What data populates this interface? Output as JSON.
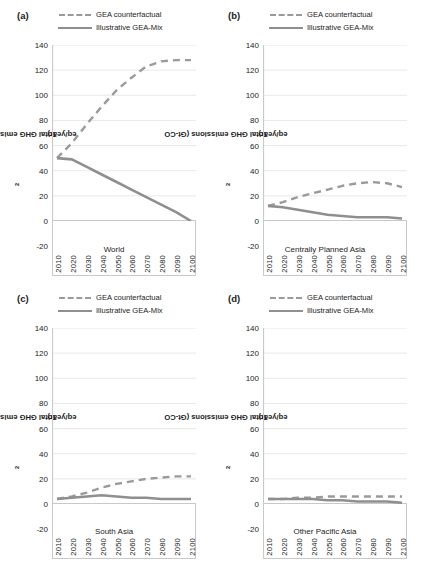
{
  "figure": {
    "axis_title_y": "Total GHG emissions (Gt-CO",
    "axis_title_y_sub": "2",
    "axis_title_y_tail": "eq/year)"
  },
  "legend": {
    "counterfactual": "GEA counterfactual",
    "gea_mix": "Illustrative GEA-Mix"
  },
  "colors": {
    "counterfactual_line": "#9a9a9a",
    "gea_mix_line": "#8f8f8f",
    "gridline": "#e2e2e2",
    "axis": "#c9c9c9",
    "text": "#1c1c1c"
  },
  "panels": [
    {
      "letter": "(a)",
      "region": "World"
    },
    {
      "letter": "(b)",
      "region": "Centrally Planned Asia"
    },
    {
      "letter": "(c)",
      "region": "South Asia"
    },
    {
      "letter": "(d)",
      "region": "Other Pacific Asia"
    }
  ],
  "chart_data": [
    {
      "type": "line",
      "panel": "(a)",
      "title": "World",
      "xlabel": "",
      "ylabel": "Total GHG emissions (Gt-CO2eq/year)",
      "x": [
        2010,
        2020,
        2030,
        2040,
        2050,
        2060,
        2070,
        2080,
        2090,
        2100
      ],
      "xticklabels": [
        "2010",
        "2020",
        "2030",
        "2040",
        "2050",
        "2060",
        "2070",
        "2080",
        "2090",
        "2100"
      ],
      "yticks": [
        -20,
        0,
        20,
        40,
        60,
        80,
        100,
        120,
        140
      ],
      "ylim": [
        -20,
        140
      ],
      "grid": true,
      "legend_position": "top",
      "series": [
        {
          "name": "GEA counterfactual",
          "style": "dashed",
          "values": [
            50,
            62,
            77,
            91,
            104,
            114,
            123,
            127,
            128,
            128
          ]
        },
        {
          "name": "Illustrative GEA-Mix",
          "style": "solid",
          "values": [
            50,
            49,
            43,
            37,
            31,
            25,
            19,
            13,
            7,
            0
          ]
        }
      ]
    },
    {
      "type": "line",
      "panel": "(b)",
      "title": "Centrally Planned Asia",
      "xlabel": "",
      "ylabel": "Total GHG emissions (Gt-CO2eq/year)",
      "x": [
        2010,
        2020,
        2030,
        2040,
        2050,
        2060,
        2070,
        2080,
        2090,
        2100
      ],
      "xticklabels": [
        "2010",
        "2020",
        "2030",
        "2040",
        "2050",
        "2060",
        "2070",
        "2080",
        "2090",
        "2100"
      ],
      "yticks": [
        -20,
        0,
        20,
        40,
        60,
        80,
        100,
        120,
        140
      ],
      "ylim": [
        -20,
        140
      ],
      "grid": true,
      "legend_position": "top",
      "series": [
        {
          "name": "GEA counterfactual",
          "style": "dashed",
          "values": [
            12,
            15,
            19,
            22,
            25,
            28,
            30,
            31,
            30,
            27
          ]
        },
        {
          "name": "Illustrative GEA-Mix",
          "style": "solid",
          "values": [
            12,
            11,
            9,
            7,
            5,
            4,
            3,
            3,
            3,
            2
          ]
        }
      ]
    },
    {
      "type": "line",
      "panel": "(c)",
      "title": "South Asia",
      "xlabel": "",
      "ylabel": "Total GHG emissions (Gt-CO2eq/year)",
      "x": [
        2010,
        2020,
        2030,
        2040,
        2050,
        2060,
        2070,
        2080,
        2090,
        2100
      ],
      "xticklabels": [
        "2010",
        "2020",
        "2030",
        "2040",
        "2050",
        "2060",
        "2070",
        "2080",
        "2090",
        "2100"
      ],
      "yticks": [
        -20,
        0,
        20,
        40,
        60,
        80,
        100,
        120,
        140
      ],
      "ylim": [
        -20,
        140
      ],
      "grid": true,
      "legend_position": "top",
      "series": [
        {
          "name": "GEA counterfactual",
          "style": "dashed",
          "values": [
            4,
            6,
            9,
            13,
            16,
            18,
            20,
            21,
            22,
            22
          ]
        },
        {
          "name": "Illustrative GEA-Mix",
          "style": "solid",
          "values": [
            4,
            5,
            6,
            7,
            6,
            5,
            5,
            4,
            4,
            4
          ]
        }
      ]
    },
    {
      "type": "line",
      "panel": "(d)",
      "title": "Other Pacific Asia",
      "xlabel": "",
      "ylabel": "Total GHG emissions (Gt-CO2eq/year)",
      "x": [
        2010,
        2020,
        2030,
        2040,
        2050,
        2060,
        2070,
        2080,
        2090,
        2100
      ],
      "xticklabels": [
        "2010",
        "2020",
        "2030",
        "2040",
        "2050",
        "2060",
        "2070",
        "2080",
        "2090",
        "2100"
      ],
      "yticks": [
        -20,
        0,
        20,
        40,
        60,
        80,
        100,
        120,
        140
      ],
      "ylim": [
        -20,
        140
      ],
      "grid": true,
      "legend_position": "top",
      "series": [
        {
          "name": "GEA counterfactual",
          "style": "dashed",
          "values": [
            4,
            4,
            5,
            5,
            6,
            6,
            6,
            6,
            6,
            6
          ]
        },
        {
          "name": "Illustrative GEA-Mix",
          "style": "solid",
          "values": [
            4,
            4,
            4,
            4,
            3,
            3,
            2,
            2,
            2,
            1
          ]
        }
      ]
    }
  ]
}
